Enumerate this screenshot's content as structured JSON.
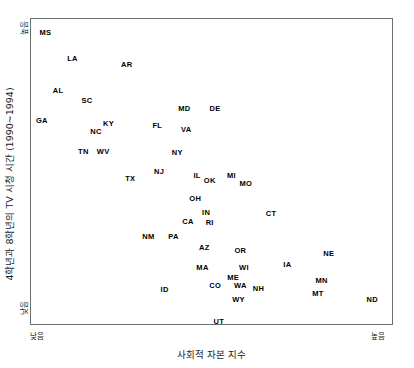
{
  "chart_data": {
    "type": "scatter",
    "title": "",
    "xlabel": "사회적 자본 지수",
    "ylabel": "4학년과 8학년의 TV 시청 시간 (1990~1994)",
    "x_axis": {
      "low_label": "낮음",
      "high_label": "높음",
      "range_hint": "ordinal low-to-high, unlabeled numeric scale"
    },
    "y_axis": {
      "low_label": "낮음",
      "high_label": "높음",
      "range_hint": "ordinal low-to-high, unlabeled numeric scale"
    },
    "grid": false,
    "legend": false,
    "marker_style": "text-label-only",
    "point_count": 50,
    "points": [
      {
        "label": "MS",
        "x": 4.0,
        "y": 95.5
      },
      {
        "label": "LA",
        "x": 11.5,
        "y": 87.0
      },
      {
        "label": "AR",
        "x": 26.5,
        "y": 85.0
      },
      {
        "label": "AL",
        "x": 7.5,
        "y": 76.5
      },
      {
        "label": "SC",
        "x": 15.5,
        "y": 73.0
      },
      {
        "label": "MD",
        "x": 42.5,
        "y": 70.5
      },
      {
        "label": "DE",
        "x": 51.0,
        "y": 70.5
      },
      {
        "label": "GA",
        "x": 3.0,
        "y": 66.5
      },
      {
        "label": "NC",
        "x": 18.0,
        "y": 63.0
      },
      {
        "label": "KY",
        "x": 21.5,
        "y": 65.5
      },
      {
        "label": "FL",
        "x": 35.0,
        "y": 65.0
      },
      {
        "label": "VA",
        "x": 43.0,
        "y": 63.5
      },
      {
        "label": "TN",
        "x": 14.5,
        "y": 56.5
      },
      {
        "label": "WV",
        "x": 20.0,
        "y": 56.5
      },
      {
        "label": "NY",
        "x": 40.5,
        "y": 56.0
      },
      {
        "label": "NJ",
        "x": 35.5,
        "y": 50.0
      },
      {
        "label": "TX",
        "x": 27.5,
        "y": 47.5
      },
      {
        "label": "IL",
        "x": 46.0,
        "y": 48.5
      },
      {
        "label": "OK",
        "x": 49.5,
        "y": 47.0
      },
      {
        "label": "MI",
        "x": 55.5,
        "y": 48.5
      },
      {
        "label": "MO",
        "x": 59.5,
        "y": 46.0
      },
      {
        "label": "OH",
        "x": 45.5,
        "y": 41.0
      },
      {
        "label": "IN",
        "x": 48.5,
        "y": 36.5
      },
      {
        "label": "CT",
        "x": 66.5,
        "y": 36.0
      },
      {
        "label": "CA",
        "x": 43.5,
        "y": 33.5
      },
      {
        "label": "RI",
        "x": 49.5,
        "y": 33.0
      },
      {
        "label": "NM",
        "x": 32.5,
        "y": 28.5
      },
      {
        "label": "PA",
        "x": 39.5,
        "y": 28.5
      },
      {
        "label": "AZ",
        "x": 48.0,
        "y": 25.0
      },
      {
        "label": "OR",
        "x": 58.0,
        "y": 24.0
      },
      {
        "label": "NE",
        "x": 82.5,
        "y": 23.0
      },
      {
        "label": "MA",
        "x": 47.5,
        "y": 18.5
      },
      {
        "label": "WI",
        "x": 59.0,
        "y": 18.5
      },
      {
        "label": "IA",
        "x": 71.0,
        "y": 19.5
      },
      {
        "label": "ME",
        "x": 56.0,
        "y": 15.0
      },
      {
        "label": "CO",
        "x": 51.0,
        "y": 12.5
      },
      {
        "label": "WA",
        "x": 58.0,
        "y": 12.5
      },
      {
        "label": "NH",
        "x": 63.0,
        "y": 11.5
      },
      {
        "label": "MN",
        "x": 80.5,
        "y": 14.0
      },
      {
        "label": "MT",
        "x": 79.5,
        "y": 10.0
      },
      {
        "label": "ID",
        "x": 37.0,
        "y": 11.0
      },
      {
        "label": "WY",
        "x": 57.5,
        "y": 8.0
      },
      {
        "label": "ND",
        "x": 94.5,
        "y": 8.0
      },
      {
        "label": "UT",
        "x": 52.0,
        "y": 0.5
      }
    ]
  },
  "axis": {
    "y_title": "4학년과 8학년의 TV 시청 시간 (1990~1994)",
    "x_title": "사회적 자본 지수",
    "y_high": "높음",
    "y_low": "낮음",
    "x_low": "낮음",
    "x_high": "높음"
  },
  "labels": {
    "MS": "MS",
    "LA": "LA",
    "AR": "AR",
    "AL": "AL",
    "SC": "SC",
    "MD": "MD",
    "DE": "DE",
    "GA": "GA",
    "NC": "NC",
    "KY": "KY",
    "FL": "FL",
    "VA": "VA",
    "TN": "TN",
    "WV": "WV",
    "NY": "NY",
    "NJ": "NJ",
    "TX": "TX",
    "IL": "IL",
    "OK": "OK",
    "MI": "MI",
    "MO": "MO",
    "OH": "OH",
    "IN": "IN",
    "CT": "CT",
    "CA": "CA",
    "RI": "RI",
    "NM": "NM",
    "PA": "PA",
    "AZ": "AZ",
    "OR": "OR",
    "NE": "NE",
    "MA": "MA",
    "WI": "WI",
    "IA": "IA",
    "ME": "ME",
    "CO": "CO",
    "WA": "WA",
    "NH": "NH",
    "MN": "MN",
    "MT": "MT",
    "ID": "ID",
    "WY": "WY",
    "ND": "ND",
    "UT": "UT"
  }
}
